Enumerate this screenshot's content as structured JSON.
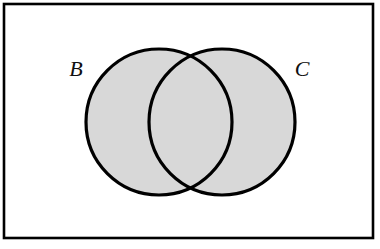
{
  "figure": {
    "type": "venn-diagram",
    "width": 380,
    "height": 249
  },
  "colors": {
    "background": "#ffffff",
    "frame_stroke": "#000000",
    "circle_stroke": "#000000",
    "circle_fill": "#d8d8d8",
    "label_color": "#101010"
  },
  "frame": {
    "name": "universal-set-rectangle",
    "x": 4,
    "y": 4,
    "width": 369,
    "height": 234,
    "stroke_width": 2.6
  },
  "sets": [
    {
      "id": "B",
      "label": "B",
      "cx": 159,
      "cy": 122,
      "r": 73,
      "shaded": true,
      "label_x": 76,
      "label_y": 76,
      "label_font_size": 22
    },
    {
      "id": "C",
      "label": "C",
      "cx": 222,
      "cy": 122,
      "r": 73,
      "shaded": true,
      "label_x": 302,
      "label_y": 76,
      "label_font_size": 22
    }
  ],
  "geometry": {
    "circle_stroke_width": 3.2,
    "intersection_top": {
      "x": 190,
      "y": 52
    },
    "intersection_bottom": {
      "x": 190,
      "y": 190
    },
    "shaded_region": "B union C"
  }
}
